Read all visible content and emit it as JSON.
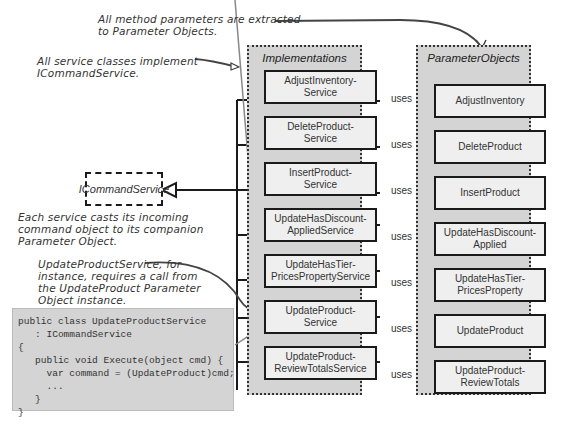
{
  "annotations": {
    "parameters": "All method parameters are extracted\nto Parameter Objects.",
    "implement": "All service classes implement\nICommandService.",
    "casts": "Each service casts its incoming\ncommand object to its companion\nParameter Object.",
    "instance": "UpdateProductService, for\ninstance, requires a call from\nthe UpdateProduct Parameter\nObject instance."
  },
  "interface": {
    "label": "ICommandService"
  },
  "panels": {
    "implementations": {
      "title": "Implementations"
    },
    "parameter_objects": {
      "title": "ParameterObjects"
    }
  },
  "relation_label": "uses",
  "services": [
    {
      "label": "AdjustInventory-\nService"
    },
    {
      "label": "DeleteProduct-\nService"
    },
    {
      "label": "InsertProduct-\nService"
    },
    {
      "label": "UpdateHasDiscount-\nAppliedService"
    },
    {
      "label": "UpdateHasTier-\nPricesPropertyService"
    },
    {
      "label": "UpdateProduct-\nService"
    },
    {
      "label": "UpdateProduct-\nReviewTotalsService"
    }
  ],
  "parameter_objects": [
    {
      "label": "AdjustInventory"
    },
    {
      "label": "DeleteProduct"
    },
    {
      "label": "InsertProduct"
    },
    {
      "label": "UpdateHasDiscount-\nApplied"
    },
    {
      "label": "UpdateHasTier-\nPricesProperty"
    },
    {
      "label": "UpdateProduct"
    },
    {
      "label": "UpdateProduct-\nReviewTotals"
    }
  ],
  "code_sample": "public class UpdateProductService\n   : ICommandService\n{\n   public void Execute(object cmd) {\n     var command = (UpdateProduct)cmd;\n     ...\n   }\n}"
}
